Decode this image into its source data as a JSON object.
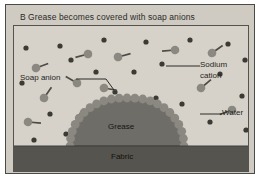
{
  "figure": {
    "panel_letter": "B",
    "caption": "Grease becomes covered with soap anions",
    "background_color": "#cfcbc2",
    "water_color": "#d6d2c9",
    "grease_color": "#6f6d68",
    "fabric_color": "#56544f",
    "particle_color": "#8a8880",
    "frame_color": "#4a4a46"
  },
  "labels": {
    "soap_anion": "Soap anion",
    "sodium_cation_line1": "Sodium",
    "sodium_cation_line2": "cation",
    "water": "Water",
    "grease": "Grease",
    "fabric": "Fabric"
  },
  "diagram_data": {
    "type": "diagram",
    "subject": "Soap micelle formation on grease attached to fabric",
    "regions": [
      {
        "name": "water",
        "label": "Water",
        "description": "Bulk aqueous phase filling the scene"
      },
      {
        "name": "grease",
        "label": "Grease",
        "description": "Semicircular dome of grease resting on the fabric"
      },
      {
        "name": "fabric",
        "label": "Fabric",
        "description": "Dark horizontal band at the base"
      }
    ],
    "species": [
      {
        "name": "soap-anion",
        "label": "Soap anion",
        "glyph": "circle-with-tail",
        "description": "Hydrophilic head with hydrophobic hydrocarbon tail"
      },
      {
        "name": "sodium-cation",
        "label": "Sodium cation",
        "glyph": "small-dot",
        "description": "Small dark dots dispersed in the water"
      }
    ],
    "free_soap_anions": [
      {
        "x": 22,
        "y": 42,
        "angle": -20
      },
      {
        "x": 74,
        "y": 28,
        "angle": 165
      },
      {
        "x": 104,
        "y": 31,
        "angle": -15
      },
      {
        "x": 161,
        "y": 24,
        "angle": 175
      },
      {
        "x": 198,
        "y": 27,
        "angle": -35
      },
      {
        "x": 30,
        "y": 72,
        "angle": -55
      },
      {
        "x": 90,
        "y": 62,
        "angle": 10
      },
      {
        "x": 120,
        "y": 82,
        "angle": 175
      },
      {
        "x": 187,
        "y": 62,
        "angle": -40
      },
      {
        "x": 218,
        "y": 84,
        "angle": 160
      },
      {
        "x": 14,
        "y": 96,
        "angle": 5
      },
      {
        "x": 63,
        "y": 57,
        "angle": -150
      }
    ],
    "sodium_cations": [
      {
        "x": 12,
        "y": 22
      },
      {
        "x": 46,
        "y": 20
      },
      {
        "x": 90,
        "y": 14
      },
      {
        "x": 132,
        "y": 16
      },
      {
        "x": 176,
        "y": 14
      },
      {
        "x": 214,
        "y": 18
      },
      {
        "x": 8,
        "y": 57
      },
      {
        "x": 57,
        "y": 34
      },
      {
        "x": 120,
        "y": 46
      },
      {
        "x": 148,
        "y": 38
      },
      {
        "x": 206,
        "y": 48
      },
      {
        "x": 231,
        "y": 34
      },
      {
        "x": 36,
        "y": 88
      },
      {
        "x": 68,
        "y": 88
      },
      {
        "x": 101,
        "y": 66
      },
      {
        "x": 142,
        "y": 72
      },
      {
        "x": 168,
        "y": 78
      },
      {
        "x": 228,
        "y": 70
      },
      {
        "x": 20,
        "y": 114
      },
      {
        "x": 52,
        "y": 108
      },
      {
        "x": 150,
        "y": 100
      },
      {
        "x": 196,
        "y": 96
      },
      {
        "x": 232,
        "y": 104
      },
      {
        "x": 8,
        "y": 132
      },
      {
        "x": 228,
        "y": 128
      },
      {
        "x": 126,
        "y": 100
      },
      {
        "x": 82,
        "y": 46
      }
    ],
    "adsorbed_anion_count": 23,
    "grease_dome": {
      "center_x": 118,
      "base_y": 120,
      "radius_x": 62,
      "radius_y": 40
    }
  }
}
